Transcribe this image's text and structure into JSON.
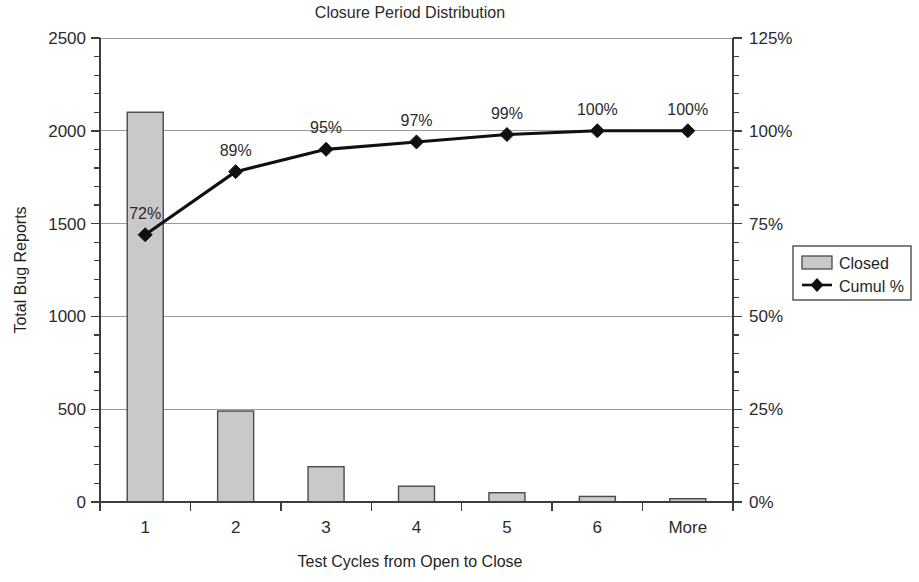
{
  "chart_data": {
    "type": "bar",
    "title": "Closure Period Distribution",
    "xlabel": "Test Cycles from Open to Close",
    "ylabel": "Total Bug Reports",
    "y2label": "",
    "categories": [
      "1",
      "2",
      "3",
      "4",
      "5",
      "6",
      "More"
    ],
    "series": [
      {
        "name": "Closed",
        "type": "bar",
        "axis": "left",
        "values": [
          2100,
          490,
          190,
          85,
          50,
          30,
          18
        ]
      },
      {
        "name": "Cumul %",
        "type": "line",
        "axis": "right",
        "values": [
          72,
          89,
          95,
          97,
          99,
          100,
          100
        ],
        "point_labels": [
          "72%",
          "89%",
          "95%",
          "97%",
          "99%",
          "100%",
          "100%"
        ]
      }
    ],
    "ylim": [
      0,
      2500
    ],
    "y_ticks": [
      0,
      500,
      1000,
      1500,
      2000,
      2500
    ],
    "y_tick_labels": [
      "0",
      "500",
      "1000",
      "1500",
      "2000",
      "2500"
    ],
    "y_minor_step": 100,
    "y2lim": [
      0,
      125
    ],
    "y2_ticks": [
      0,
      25,
      50,
      75,
      100,
      125
    ],
    "y2_tick_labels": [
      "0%",
      "25%",
      "50%",
      "75%",
      "100%",
      "125%"
    ],
    "y2_minor_step": 5,
    "grid": "horizontal",
    "legend_position": "right",
    "legend_entries": [
      {
        "label": "Closed",
        "marker": "bar-swatch",
        "color": "#c9c9c9"
      },
      {
        "label": "Cumul %",
        "marker": "line-diamond",
        "color": "#101010"
      }
    ],
    "colors": {
      "bar_fill": "#c9c9c9",
      "bar_stroke": "#4a4a4a",
      "line": "#101010",
      "grid": "#9a9a9a",
      "axis": "#3d3d3d",
      "text": "#2b2b2b",
      "background": "#ffffff"
    }
  }
}
